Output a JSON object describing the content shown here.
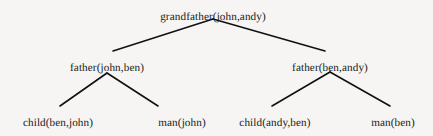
{
  "figure": {
    "kind": "proof-tree",
    "background_color": "#f6f5f3",
    "ink_color": "#1a1a1a",
    "edge_color": "#111111"
  },
  "tree": {
    "root": {
      "label": "grandfather(john,andy)",
      "x": 213,
      "y": 11
    },
    "level1": [
      {
        "label": "father(john,ben)",
        "x": 107,
        "y": 62
      },
      {
        "label": "father(ben,andy)",
        "x": 330,
        "y": 62
      }
    ],
    "leaves": [
      {
        "label": "child(ben,john)",
        "x": 58,
        "y": 117
      },
      {
        "label": "man(john)",
        "x": 182,
        "y": 117
      },
      {
        "label": "child(andy,ben)",
        "x": 275,
        "y": 117
      },
      {
        "label": "man(ben)",
        "x": 393,
        "y": 117
      }
    ],
    "edges": [
      {
        "name": "edge-root-left",
        "x1": 213,
        "y1": 19,
        "x2": 113,
        "y2": 51
      },
      {
        "name": "edge-root-right",
        "x1": 213,
        "y1": 19,
        "x2": 325,
        "y2": 51
      },
      {
        "name": "edge-father-john-left",
        "x1": 107,
        "y1": 73,
        "x2": 60,
        "y2": 106
      },
      {
        "name": "edge-father-john-right",
        "x1": 107,
        "y1": 73,
        "x2": 158,
        "y2": 106
      },
      {
        "name": "edge-father-ben-left",
        "x1": 330,
        "y1": 72,
        "x2": 272,
        "y2": 106
      },
      {
        "name": "edge-father-ben-right",
        "x1": 330,
        "y1": 72,
        "x2": 390,
        "y2": 106
      }
    ]
  }
}
